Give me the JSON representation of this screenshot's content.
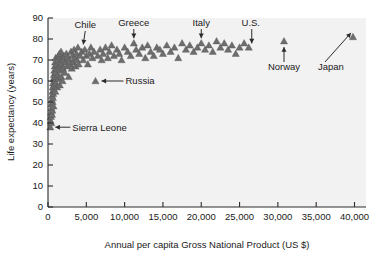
{
  "chart_data": {
    "type": "scatter",
    "title": "",
    "xlabel": "Annual per capita Gross National Product (US $)",
    "ylabel": "Life expectancy (years)",
    "xlim": [
      0,
      41500
    ],
    "ylim": [
      0,
      90
    ],
    "xticks": [
      0,
      5000,
      10000,
      15000,
      20000,
      25000,
      30000,
      35000,
      40000
    ],
    "xtick_labels": [
      "0",
      "5,000",
      "10,000",
      "15,000",
      "20,000",
      "25,000",
      "30,000",
      "35,000",
      "40,000"
    ],
    "yticks": [
      0,
      10,
      20,
      30,
      40,
      50,
      60,
      70,
      80,
      90
    ],
    "ytick_labels": [
      "0",
      "10",
      "20",
      "30",
      "40",
      "50",
      "60",
      "70",
      "80",
      "90"
    ],
    "grid": false,
    "legend": false,
    "marker": "triangle",
    "marker_color": "#6d6d6d",
    "plot_background": "#f2f2f2",
    "series": [
      {
        "name": "Countries",
        "points": [
          [
            300,
            38
          ],
          [
            350,
            41
          ],
          [
            380,
            43
          ],
          [
            400,
            45
          ],
          [
            420,
            40
          ],
          [
            450,
            47
          ],
          [
            470,
            49
          ],
          [
            500,
            51
          ],
          [
            520,
            44
          ],
          [
            540,
            53
          ],
          [
            560,
            46
          ],
          [
            580,
            55
          ],
          [
            600,
            50
          ],
          [
            620,
            57
          ],
          [
            640,
            52
          ],
          [
            660,
            59
          ],
          [
            680,
            54
          ],
          [
            700,
            61
          ],
          [
            720,
            48
          ],
          [
            750,
            56
          ],
          [
            780,
            63
          ],
          [
            800,
            58
          ],
          [
            820,
            65
          ],
          [
            850,
            60
          ],
          [
            880,
            67
          ],
          [
            900,
            62
          ],
          [
            930,
            69
          ],
          [
            950,
            55
          ],
          [
            980,
            64
          ],
          [
            1000,
            71
          ],
          [
            1050,
            59
          ],
          [
            1100,
            66
          ],
          [
            1150,
            68
          ],
          [
            1200,
            57
          ],
          [
            1250,
            70
          ],
          [
            1300,
            63
          ],
          [
            1350,
            72
          ],
          [
            1400,
            61
          ],
          [
            1450,
            67
          ],
          [
            1500,
            73
          ],
          [
            1550,
            58
          ],
          [
            1600,
            69
          ],
          [
            1650,
            65
          ],
          [
            1700,
            74
          ],
          [
            1750,
            62
          ],
          [
            1800,
            68
          ],
          [
            1850,
            71
          ],
          [
            1900,
            60
          ],
          [
            1950,
            66
          ],
          [
            2000,
            70
          ],
          [
            2100,
            72
          ],
          [
            2200,
            64
          ],
          [
            2300,
            69
          ],
          [
            2400,
            73
          ],
          [
            2500,
            67
          ],
          [
            2600,
            71
          ],
          [
            2700,
            62
          ],
          [
            2800,
            70
          ],
          [
            2900,
            68
          ],
          [
            3000,
            74
          ],
          [
            3100,
            66
          ],
          [
            3200,
            72
          ],
          [
            3300,
            69
          ],
          [
            3400,
            75
          ],
          [
            3500,
            71
          ],
          [
            3600,
            67
          ],
          [
            3700,
            73
          ],
          [
            3800,
            70
          ],
          [
            3900,
            76
          ],
          [
            4000,
            68
          ],
          [
            4200,
            72
          ],
          [
            4400,
            74
          ],
          [
            4600,
            70
          ],
          [
            4800,
            75
          ],
          [
            5000,
            72
          ],
          [
            5200,
            68
          ],
          [
            5400,
            73
          ],
          [
            5600,
            76
          ],
          [
            5800,
            71
          ],
          [
            6000,
            74
          ],
          [
            6200,
            60
          ],
          [
            6500,
            72
          ],
          [
            6800,
            75
          ],
          [
            7000,
            70
          ],
          [
            7200,
            73
          ],
          [
            7500,
            76
          ],
          [
            7800,
            71
          ],
          [
            8000,
            74
          ],
          [
            8300,
            77
          ],
          [
            8600,
            72
          ],
          [
            9000,
            75
          ],
          [
            9300,
            73
          ],
          [
            9600,
            70
          ],
          [
            10000,
            76
          ],
          [
            10400,
            74
          ],
          [
            10800,
            72
          ],
          [
            11200,
            78
          ],
          [
            11500,
            75
          ],
          [
            11900,
            73
          ],
          [
            12300,
            76
          ],
          [
            12700,
            71
          ],
          [
            13000,
            77
          ],
          [
            13400,
            74
          ],
          [
            13800,
            72
          ],
          [
            14200,
            76
          ],
          [
            14600,
            75
          ],
          [
            15000,
            73
          ],
          [
            15500,
            77
          ],
          [
            16000,
            74
          ],
          [
            16500,
            76
          ],
          [
            17000,
            71
          ],
          [
            17500,
            78
          ],
          [
            18000,
            75
          ],
          [
            18500,
            77
          ],
          [
            19000,
            74
          ],
          [
            19500,
            76
          ],
          [
            20000,
            78
          ],
          [
            20500,
            75
          ],
          [
            21000,
            77
          ],
          [
            21500,
            74
          ],
          [
            22000,
            79
          ],
          [
            22500,
            76
          ],
          [
            23000,
            78
          ],
          [
            23500,
            75
          ],
          [
            24000,
            77
          ],
          [
            24500,
            73
          ],
          [
            25000,
            76
          ],
          [
            25600,
            78
          ],
          [
            26200,
            76
          ],
          [
            30800,
            79
          ],
          [
            39800,
            81
          ]
        ]
      }
    ],
    "annotations": [
      {
        "label": "Chile",
        "country_x": 4600,
        "country_y": 75
      },
      {
        "label": "Greece",
        "country_x": 11200,
        "country_y": 78
      },
      {
        "label": "Italy",
        "country_x": 20000,
        "country_y": 78
      },
      {
        "label": "U.S.",
        "country_x": 26200,
        "country_y": 76
      },
      {
        "label": "Norway",
        "country_x": 30800,
        "country_y": 79
      },
      {
        "label": "Japan",
        "country_x": 39800,
        "country_y": 81
      },
      {
        "label": "Russia",
        "country_x": 6200,
        "country_y": 60
      },
      {
        "label": "Sierra Leone",
        "country_x": 300,
        "country_y": 38
      }
    ]
  }
}
